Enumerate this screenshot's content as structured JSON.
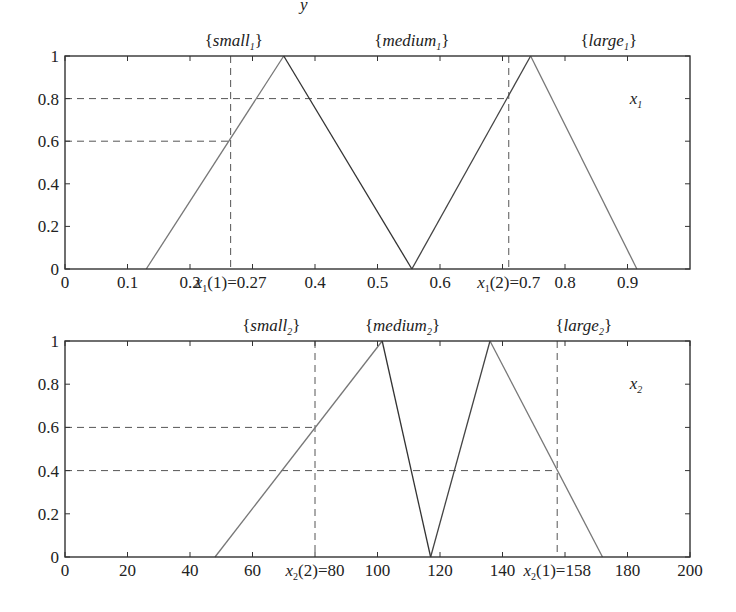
{
  "header_fragment": "y",
  "chart_data": [
    {
      "type": "line",
      "title": "",
      "variable_label": "x",
      "variable_sub": "1",
      "xlabel": "",
      "ylabel": "",
      "xlim": [
        0,
        1
      ],
      "ylim": [
        0,
        1
      ],
      "grid": false,
      "set_labels": [
        {
          "name": "small",
          "sub": "1",
          "x": 0.27
        },
        {
          "name": "medium",
          "sub": "1",
          "x": 0.555
        },
        {
          "name": "large",
          "sub": "1",
          "x": 0.87
        }
      ],
      "x_ticks": [
        {
          "v": 0,
          "label": "0"
        },
        {
          "v": 0.1,
          "label": "0.1"
        },
        {
          "v": 0.2,
          "label": "0.2"
        },
        {
          "v": 0.3,
          "label": ""
        },
        {
          "v": 0.4,
          "label": "0.4"
        },
        {
          "v": 0.5,
          "label": "0.5"
        },
        {
          "v": 0.6,
          "label": "0.6"
        },
        {
          "v": 0.7,
          "label": ""
        },
        {
          "v": 0.8,
          "label": "0.8"
        },
        {
          "v": 0.9,
          "label": "0.9"
        }
      ],
      "y_ticks": [
        {
          "v": 0,
          "label": "0"
        },
        {
          "v": 0.2,
          "label": "0.2"
        },
        {
          "v": 0.4,
          "label": "0.4"
        },
        {
          "v": 0.6,
          "label": "0.6"
        },
        {
          "v": 0.8,
          "label": "0.8"
        },
        {
          "v": 1,
          "label": "1"
        }
      ],
      "series": [
        {
          "name": "small_1",
          "x": [
            0.13,
            0.35
          ],
          "y": [
            0,
            1
          ],
          "color": "#777777"
        },
        {
          "name": "medium_1 (falling)",
          "x": [
            0.35,
            0.555
          ],
          "y": [
            1,
            0
          ],
          "color": "#333333"
        },
        {
          "name": "medium_1 (rising)",
          "x": [
            0.555,
            0.745
          ],
          "y": [
            0,
            1
          ],
          "color": "#444444"
        },
        {
          "name": "large_1",
          "x": [
            0.745,
            0.915
          ],
          "y": [
            1,
            0
          ],
          "color": "#777777"
        }
      ],
      "annotations": [
        {
          "type": "vline",
          "x": 0.265,
          "label": "x₁(1)=0.27",
          "label_main": "x",
          "label_sub": "1",
          "label_rest": "(1)=0.27"
        },
        {
          "type": "vline",
          "x": 0.71,
          "label": "x₁(2)=0.7",
          "label_main": "x",
          "label_sub": "1",
          "label_rest": "(2)=0.7"
        },
        {
          "type": "hline",
          "y": 0.8,
          "x_end": 0.71
        },
        {
          "type": "hline",
          "y": 0.6,
          "x_end": 0.265
        }
      ]
    },
    {
      "type": "line",
      "title": "",
      "variable_label": "x",
      "variable_sub": "2",
      "xlabel": "",
      "ylabel": "",
      "xlim": [
        0,
        200
      ],
      "ylim": [
        0,
        1
      ],
      "grid": false,
      "set_labels": [
        {
          "name": "small",
          "sub": "2",
          "x": 66
        },
        {
          "name": "medium",
          "sub": "2",
          "x": 108
        },
        {
          "name": "large",
          "sub": "2",
          "x": 166
        }
      ],
      "x_ticks": [
        {
          "v": 0,
          "label": "0"
        },
        {
          "v": 20,
          "label": "20"
        },
        {
          "v": 40,
          "label": "40"
        },
        {
          "v": 60,
          "label": "60"
        },
        {
          "v": 80,
          "label": ""
        },
        {
          "v": 100,
          "label": "100"
        },
        {
          "v": 120,
          "label": "120"
        },
        {
          "v": 140,
          "label": "140"
        },
        {
          "v": 160,
          "label": ""
        },
        {
          "v": 180,
          "label": "180"
        },
        {
          "v": 200,
          "label": "200"
        }
      ],
      "y_ticks": [
        {
          "v": 0,
          "label": "0"
        },
        {
          "v": 0.2,
          "label": "0.2"
        },
        {
          "v": 0.4,
          "label": "0.4"
        },
        {
          "v": 0.6,
          "label": "0.6"
        },
        {
          "v": 0.8,
          "label": "0.8"
        },
        {
          "v": 1,
          "label": "1"
        }
      ],
      "series": [
        {
          "name": "small_2",
          "x": [
            48,
            101.5
          ],
          "y": [
            0,
            1
          ],
          "color": "#777777"
        },
        {
          "name": "medium_2 (falling)",
          "x": [
            101.5,
            117
          ],
          "y": [
            1,
            0
          ],
          "color": "#333333"
        },
        {
          "name": "medium_2 (rising)",
          "x": [
            117,
            136
          ],
          "y": [
            0,
            1
          ],
          "color": "#444444"
        },
        {
          "name": "large_2",
          "x": [
            136,
            172
          ],
          "y": [
            1,
            0
          ],
          "color": "#777777"
        }
      ],
      "annotations": [
        {
          "type": "vline",
          "x": 80,
          "label": "x₂(2)=80",
          "label_main": "x",
          "label_sub": "2",
          "label_rest": "(2)=80"
        },
        {
          "type": "vline",
          "x": 157.5,
          "label": "x₂(1)=158",
          "label_main": "x",
          "label_sub": "2",
          "label_rest": "(1)=158"
        },
        {
          "type": "hline",
          "y": 0.6,
          "x_end": 80
        },
        {
          "type": "hline",
          "y": 0.4,
          "x_end": 157.5
        }
      ]
    }
  ]
}
